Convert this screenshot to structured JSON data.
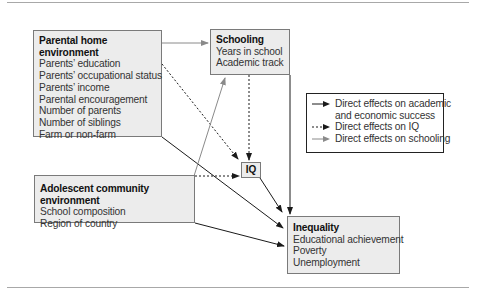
{
  "diagram": {
    "boxes": {
      "parental": {
        "title": "Parental home environment",
        "items": [
          "Parents’ education",
          "Parents’ occupational status",
          "Parents’ income",
          "Parental encouragement",
          "Number of parents",
          "Number of siblings",
          "Farm or non-farm"
        ]
      },
      "schooling": {
        "title": "Schooling",
        "items": [
          "Years in school",
          "Academic track"
        ]
      },
      "adolescent": {
        "title": "Adolescent community environment",
        "items": [
          "School composition",
          "Region of country"
        ]
      },
      "iq": {
        "title": "IQ"
      },
      "inequality": {
        "title": "Inequality",
        "items": [
          "Educational achievement",
          "Poverty",
          "Unemployment"
        ]
      }
    },
    "legend": [
      {
        "style": "solid-black",
        "label_line1": "Direct effects on academic",
        "label_line2": "and economic success"
      },
      {
        "style": "dotted-black",
        "label_line1": "Direct effects on IQ"
      },
      {
        "style": "solid-gray",
        "label_line1": "Direct effects on schooling"
      }
    ],
    "edges": [
      {
        "from": "Parental home environment",
        "to": "Schooling",
        "style": "solid-gray"
      },
      {
        "from": "Parental home environment",
        "to": "IQ",
        "style": "dotted-black"
      },
      {
        "from": "Parental home environment",
        "to": "Inequality",
        "style": "solid-black"
      },
      {
        "from": "Adolescent community environment",
        "to": "Schooling",
        "style": "solid-gray"
      },
      {
        "from": "Adolescent community environment",
        "to": "IQ",
        "style": "dotted-black"
      },
      {
        "from": "Adolescent community environment",
        "to": "Inequality",
        "style": "solid-black"
      },
      {
        "from": "Schooling",
        "to": "IQ",
        "style": "dotted-black"
      },
      {
        "from": "Schooling",
        "to": "Inequality",
        "style": "solid-black"
      },
      {
        "from": "IQ",
        "to": "Inequality",
        "style": "solid-black"
      }
    ],
    "colors": {
      "box_fill": "#ececec",
      "box_border": "#7a7a7a",
      "black_arrow": "#1a1a1a",
      "gray_arrow": "#8a8a8a",
      "rule": "#a8a8a8"
    }
  }
}
